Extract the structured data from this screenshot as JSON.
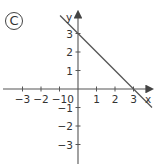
{
  "label": "C",
  "chart_data": {
    "type": "line",
    "title": "",
    "xlabel": "x",
    "ylabel": "y",
    "xlim": [
      -4,
      4
    ],
    "ylim": [
      -4,
      4
    ],
    "x_ticks": [
      -3,
      -2,
      -1,
      1,
      2,
      3
    ],
    "y_ticks": [
      3,
      2,
      1,
      -1,
      -2,
      -3
    ],
    "x_tick_labels": [
      "−3",
      "−2",
      "−1",
      "1",
      "2",
      "3"
    ],
    "y_tick_labels": [
      "3",
      "2",
      "1",
      "−1",
      "−2",
      "−3"
    ],
    "origin_label": "0",
    "grid": false,
    "series": [
      {
        "name": "line",
        "equation": "y = -x + 3",
        "x": [
          -1,
          0,
          3,
          4
        ],
        "y": [
          4,
          3,
          0,
          -1
        ]
      }
    ]
  },
  "colors": {
    "axis": "#444444",
    "line": "#555555",
    "text": "#333333"
  }
}
